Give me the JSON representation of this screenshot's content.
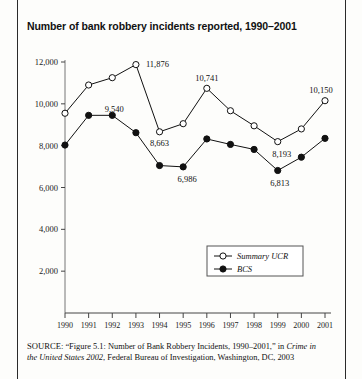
{
  "page": {
    "title": "Number of bank robbery incidents reported, 1990–2001"
  },
  "source_note": {
    "label": "SOURCE:",
    "quoted_figure": "“Figure 5.1: Number of Bank Robbery Incidents, 1990–2001,”",
    "in_word": "in",
    "publication": "Crime in the United States 2002",
    "agency": ", Federal Bureau of Investigation,",
    "place_year": "Washington, DC, 2003"
  },
  "legend": {
    "items": [
      {
        "label": "Summary UCR",
        "marker": "open-circle",
        "color": "#111111"
      },
      {
        "label": "BCS",
        "marker": "filled-circle",
        "color": "#111111"
      }
    ]
  },
  "chart_data": {
    "type": "line",
    "title": "Number of bank robbery incidents reported, 1990–2001",
    "xlabel": "",
    "ylabel": "",
    "grid": false,
    "legend_position": "bottom-right",
    "ylim": [
      0,
      12000
    ],
    "ytick_labels": [
      "2,000",
      "4,000",
      "6,000",
      "8,000",
      "10,000",
      "12,000"
    ],
    "yticks": [
      2000,
      4000,
      6000,
      8000,
      10000,
      12000
    ],
    "categories": [
      "1990",
      "1991",
      "1992",
      "1993",
      "1994",
      "1995",
      "1996",
      "1997",
      "1998",
      "1999",
      "2000",
      "2001"
    ],
    "series": [
      {
        "name": "Summary UCR",
        "marker": "open-circle",
        "values": [
          9550,
          10900,
          11250,
          11876,
          8663,
          9050,
          10741,
          9670,
          8950,
          8193,
          8800,
          10150
        ],
        "point_labels": {
          "1993": "11,876",
          "1994": "8,663",
          "1996": "10,741",
          "1999": "8,193",
          "2001": "10,150"
        }
      },
      {
        "name": "BCS",
        "marker": "filled-circle",
        "values": [
          8030,
          9450,
          9450,
          8620,
          7050,
          6986,
          8320,
          8060,
          7820,
          6813,
          7450,
          8350
        ],
        "point_labels": {
          "1991": "9,540",
          "1995": "6,986",
          "1999": "6,813"
        }
      }
    ]
  }
}
